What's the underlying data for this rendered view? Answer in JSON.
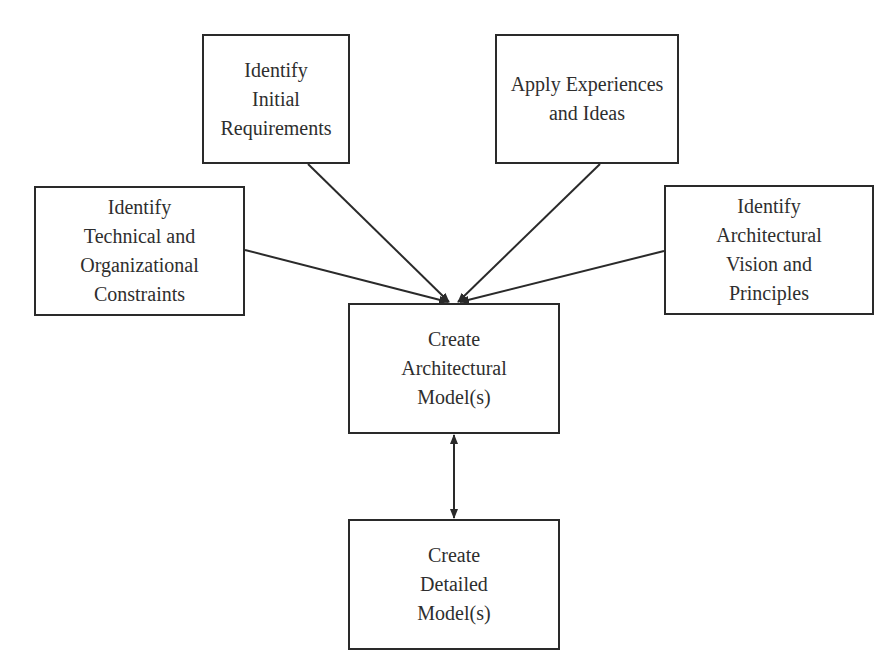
{
  "diagram": {
    "nodes": [
      {
        "id": "identify-initial-requirements",
        "label": "Identify\nInitial\nRequirements",
        "x": 202,
        "y": 34,
        "w": 148,
        "h": 130
      },
      {
        "id": "apply-experiences-and-ideas",
        "label": "Apply Experiences\nand Ideas",
        "x": 495,
        "y": 34,
        "w": 184,
        "h": 130
      },
      {
        "id": "identify-technical-constraints",
        "label": "Identify\nTechnical and\nOrganizational\nConstraints",
        "x": 34,
        "y": 186,
        "w": 211,
        "h": 130
      },
      {
        "id": "identify-architectural-vision",
        "label": "Identify\nArchitectural\nVision and\nPrinciples",
        "x": 664,
        "y": 185,
        "w": 210,
        "h": 130
      },
      {
        "id": "create-architectural-models",
        "label": "Create\nArchitectural\nModel(s)",
        "x": 348,
        "y": 303,
        "w": 212,
        "h": 131
      },
      {
        "id": "create-detailed-models",
        "label": "Create\nDetailed\nModel(s)",
        "x": 348,
        "y": 519,
        "w": 212,
        "h": 131
      }
    ],
    "edges": [
      {
        "from": "identify-initial-requirements",
        "to": "create-architectural-models",
        "type": "arrow"
      },
      {
        "from": "apply-experiences-and-ideas",
        "to": "create-architectural-models",
        "type": "arrow"
      },
      {
        "from": "identify-technical-constraints",
        "to": "create-architectural-models",
        "type": "arrow"
      },
      {
        "from": "identify-architectural-vision",
        "to": "create-architectural-models",
        "type": "arrow"
      },
      {
        "from": "create-architectural-models",
        "to": "create-detailed-models",
        "type": "bidirectional"
      }
    ],
    "colors": {
      "stroke": "#2a2a2a",
      "text": "#2e2e2e",
      "background": "#ffffff"
    }
  }
}
